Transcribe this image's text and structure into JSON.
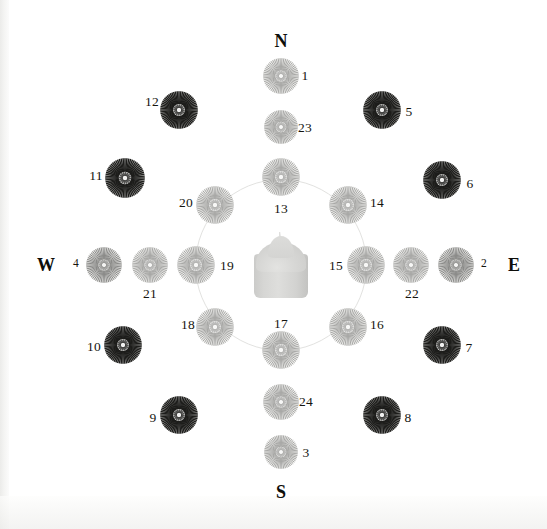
{
  "figure": {
    "width": 547,
    "height": 529,
    "background": "#ffffff",
    "center": {
      "x": 281,
      "y": 265
    },
    "guide_ring": {
      "radius": 86,
      "color": "#e2e2e0"
    },
    "center_object": {
      "name": "candle",
      "color": "#d6d6d4"
    }
  },
  "cardinals": [
    {
      "key": "north",
      "label": "N",
      "x": 281,
      "y": 41
    },
    {
      "key": "south",
      "label": "S",
      "x": 281,
      "y": 492
    },
    {
      "key": "west",
      "label": "W",
      "x": 46,
      "y": 265
    },
    {
      "key": "east",
      "label": "E",
      "x": 514,
      "y": 265
    }
  ],
  "rings": [
    {
      "name": "inner",
      "radius": 86
    },
    {
      "name": "middle",
      "radius": 131
    },
    {
      "name": "outer",
      "radius": 176
    }
  ],
  "discs": [
    {
      "id": "1",
      "x": 281,
      "y": 76,
      "r": 18,
      "tone": "light",
      "label": "1",
      "label_x": 305,
      "label_y": 76,
      "label_size": "normal"
    },
    {
      "id": "23",
      "x": 281,
      "y": 127,
      "r": 17,
      "tone": "light",
      "label": "23",
      "label_x": 305,
      "label_y": 128,
      "label_size": "normal"
    },
    {
      "id": "13",
      "x": 281,
      "y": 177,
      "r": 19,
      "tone": "light",
      "label": "13",
      "label_x": 281,
      "label_y": 209,
      "label_size": "normal"
    },
    {
      "id": "17",
      "x": 281,
      "y": 350,
      "r": 19,
      "tone": "light",
      "label": "17",
      "label_x": 281,
      "label_y": 324,
      "label_size": "normal"
    },
    {
      "id": "24",
      "x": 281,
      "y": 402,
      "r": 18,
      "tone": "light",
      "label": "24",
      "label_x": 306,
      "label_y": 402,
      "label_size": "normal"
    },
    {
      "id": "3",
      "x": 281,
      "y": 452,
      "r": 17,
      "tone": "light",
      "label": "3",
      "label_x": 306,
      "label_y": 453,
      "label_size": "normal"
    },
    {
      "id": "19",
      "x": 196,
      "y": 265,
      "r": 19,
      "tone": "light",
      "label": "19",
      "label_x": 227,
      "label_y": 266,
      "label_size": "normal"
    },
    {
      "id": "21",
      "x": 150,
      "y": 265,
      "r": 18,
      "tone": "light",
      "label": "21",
      "label_x": 150,
      "label_y": 294,
      "label_size": "normal"
    },
    {
      "id": "4",
      "x": 104,
      "y": 265,
      "r": 18,
      "tone": "medium",
      "label": "4",
      "label_x": 76,
      "label_y": 264,
      "label_size": "small"
    },
    {
      "id": "15",
      "x": 366,
      "y": 265,
      "r": 19,
      "tone": "light",
      "label": "15",
      "label_x": 336,
      "label_y": 266,
      "label_size": "normal"
    },
    {
      "id": "22",
      "x": 411,
      "y": 265,
      "r": 18,
      "tone": "light",
      "label": "22",
      "label_x": 412,
      "label_y": 294,
      "label_size": "normal"
    },
    {
      "id": "2",
      "x": 456,
      "y": 265,
      "r": 18,
      "tone": "medium",
      "label": "2",
      "label_x": 484,
      "label_y": 264,
      "label_size": "small"
    },
    {
      "id": "20",
      "x": 215,
      "y": 205,
      "r": 19,
      "tone": "light",
      "label": "20",
      "label_x": 186,
      "label_y": 203,
      "label_size": "normal"
    },
    {
      "id": "12",
      "x": 179,
      "y": 110,
      "r": 19,
      "tone": "dark",
      "label": "12",
      "label_x": 152,
      "label_y": 102,
      "label_size": "normal"
    },
    {
      "id": "11",
      "x": 125,
      "y": 178,
      "r": 20,
      "tone": "dark",
      "label": "11",
      "label_x": 96,
      "label_y": 176,
      "label_size": "normal"
    },
    {
      "id": "14",
      "x": 348,
      "y": 205,
      "r": 19,
      "tone": "light",
      "label": "14",
      "label_x": 377,
      "label_y": 203,
      "label_size": "normal"
    },
    {
      "id": "5",
      "x": 382,
      "y": 110,
      "r": 19,
      "tone": "dark",
      "label": "5",
      "label_x": 409,
      "label_y": 112,
      "label_size": "normal"
    },
    {
      "id": "6",
      "x": 442,
      "y": 180,
      "r": 19,
      "tone": "dark",
      "label": "6",
      "label_x": 470,
      "label_y": 184,
      "label_size": "normal"
    },
    {
      "id": "18",
      "x": 215,
      "y": 327,
      "r": 19,
      "tone": "light",
      "label": "18",
      "label_x": 188,
      "label_y": 325,
      "label_size": "normal"
    },
    {
      "id": "9",
      "x": 179,
      "y": 415,
      "r": 19,
      "tone": "dark",
      "label": "9",
      "label_x": 153,
      "label_y": 418,
      "label_size": "normal"
    },
    {
      "id": "10",
      "x": 123,
      "y": 345,
      "r": 19,
      "tone": "dark",
      "label": "10",
      "label_x": 94,
      "label_y": 347,
      "label_size": "normal"
    },
    {
      "id": "16",
      "x": 348,
      "y": 327,
      "r": 19,
      "tone": "light",
      "label": "16",
      "label_x": 377,
      "label_y": 325,
      "label_size": "normal"
    },
    {
      "id": "8",
      "x": 382,
      "y": 415,
      "r": 19,
      "tone": "dark",
      "label": "8",
      "label_x": 408,
      "label_y": 418,
      "label_size": "normal"
    },
    {
      "id": "7",
      "x": 442,
      "y": 345,
      "r": 19,
      "tone": "dark",
      "label": "7",
      "label_x": 469,
      "label_y": 348,
      "label_size": "normal"
    }
  ],
  "tones": {
    "light": {
      "ray": "#a8a8a6",
      "fill": "#eeeeec",
      "core": "#f7f7f6"
    },
    "medium": {
      "ray": "#8a8a88",
      "fill": "#e4e4e2",
      "core": "#f4f4f3"
    },
    "dark": {
      "ray": "#1d1d1b",
      "fill": "#c8c8c6",
      "core": "#f2f2f1"
    }
  }
}
